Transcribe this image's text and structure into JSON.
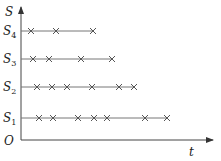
{
  "diagram": {
    "y_axis_label": "S",
    "x_axis_label": "t",
    "origin_label": "O",
    "rows": [
      {
        "label": "S",
        "sub": "4",
        "y": 31,
        "end": 93,
        "marks": [
          31,
          56,
          93
        ]
      },
      {
        "label": "S",
        "sub": "3",
        "y": 59,
        "end": 112,
        "marks": [
          33,
          49,
          81,
          112
        ]
      },
      {
        "label": "S",
        "sub": "2",
        "y": 87,
        "end": 134,
        "marks": [
          37,
          52,
          67,
          92,
          119,
          134
        ]
      },
      {
        "label": "S",
        "sub": "1",
        "y": 118,
        "end": 167,
        "marks": [
          39,
          53,
          78,
          94,
          107,
          145,
          167
        ]
      }
    ]
  }
}
